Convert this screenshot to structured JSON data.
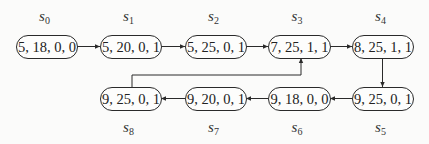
{
  "diagram": {
    "type": "state-transition",
    "nodes": [
      {
        "id": "s0",
        "label_base": "s",
        "label_sub": "0",
        "text": "5, 18, 0, 0",
        "x": 16,
        "y": 35,
        "w": 61,
        "h": 23,
        "label_pos": "above"
      },
      {
        "id": "s1",
        "label_base": "s",
        "label_sub": "1",
        "text": "5, 20, 0, 1",
        "x": 100,
        "y": 35,
        "w": 61,
        "h": 23,
        "label_pos": "above"
      },
      {
        "id": "s2",
        "label_base": "s",
        "label_sub": "2",
        "text": "5, 25, 0, 1",
        "x": 185,
        "y": 35,
        "w": 61,
        "h": 23,
        "label_pos": "above"
      },
      {
        "id": "s3",
        "label_base": "s",
        "label_sub": "3",
        "text": "7, 25, 1, 1",
        "x": 268,
        "y": 35,
        "w": 62,
        "h": 23,
        "label_pos": "above"
      },
      {
        "id": "s4",
        "label_base": "s",
        "label_sub": "4",
        "text": "8, 25, 1, 1",
        "x": 352,
        "y": 35,
        "w": 61,
        "h": 23,
        "label_pos": "above"
      },
      {
        "id": "s5",
        "label_base": "s",
        "label_sub": "5",
        "text": "9, 25, 0, 1",
        "x": 352,
        "y": 87,
        "w": 61,
        "h": 23,
        "label_pos": "below"
      },
      {
        "id": "s6",
        "label_base": "s",
        "label_sub": "6",
        "text": "9, 18, 0, 0",
        "x": 268,
        "y": 87,
        "w": 62,
        "h": 23,
        "label_pos": "below"
      },
      {
        "id": "s7",
        "label_base": "s",
        "label_sub": "7",
        "text": "9, 20, 0, 1",
        "x": 185,
        "y": 87,
        "w": 61,
        "h": 23,
        "label_pos": "below"
      },
      {
        "id": "s8",
        "label_base": "s",
        "label_sub": "8",
        "text": "9, 25, 0, 1",
        "x": 100,
        "y": 87,
        "w": 61,
        "h": 23,
        "label_pos": "below"
      }
    ],
    "edges": [
      {
        "from": "s0",
        "to": "s1",
        "points": [
          [
            77,
            46.5
          ],
          [
            100,
            46.5
          ]
        ]
      },
      {
        "from": "s1",
        "to": "s2",
        "points": [
          [
            161,
            46.5
          ],
          [
            185,
            46.5
          ]
        ]
      },
      {
        "from": "s2",
        "to": "s3",
        "points": [
          [
            246,
            46.5
          ],
          [
            268,
            46.5
          ]
        ]
      },
      {
        "from": "s3",
        "to": "s4",
        "points": [
          [
            330,
            46.5
          ],
          [
            352,
            46.5
          ]
        ]
      },
      {
        "from": "s4",
        "to": "s5",
        "points": [
          [
            382.5,
            58
          ],
          [
            382.5,
            87
          ]
        ]
      },
      {
        "from": "s5",
        "to": "s6",
        "points": [
          [
            352,
            98.5
          ],
          [
            330,
            98.5
          ]
        ]
      },
      {
        "from": "s6",
        "to": "s7",
        "points": [
          [
            268,
            98.5
          ],
          [
            246,
            98.5
          ]
        ]
      },
      {
        "from": "s7",
        "to": "s8",
        "points": [
          [
            185,
            98.5
          ],
          [
            161,
            98.5
          ]
        ]
      },
      {
        "from": "s8",
        "to": "s3",
        "points": [
          [
            132,
            87
          ],
          [
            132,
            75
          ],
          [
            301,
            75
          ],
          [
            301,
            58
          ]
        ]
      }
    ],
    "colors": {
      "stroke": "#2a2a2a",
      "text": "#222222",
      "background": "#fbfbfa"
    }
  }
}
